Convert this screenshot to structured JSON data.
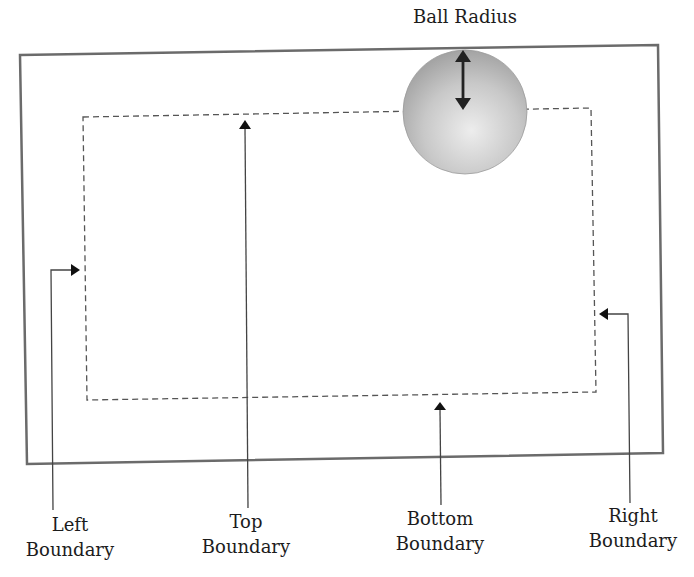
{
  "diagram": {
    "title_label": "Ball Radius",
    "labels": {
      "left": {
        "line1": "Left",
        "line2": "Boundary"
      },
      "top": {
        "line1": "Top",
        "line2": "Boundary"
      },
      "bottom": {
        "line1": "Bottom",
        "line2": "Boundary"
      },
      "right": {
        "line1": "Right",
        "line2": "Boundary"
      }
    },
    "colors": {
      "outer_border": "#6b6b6b",
      "inner_dashed": "#555555",
      "arrow": "#222222",
      "ball_light": "#e6e6e6",
      "ball_dark": "#9a9a9a"
    }
  }
}
